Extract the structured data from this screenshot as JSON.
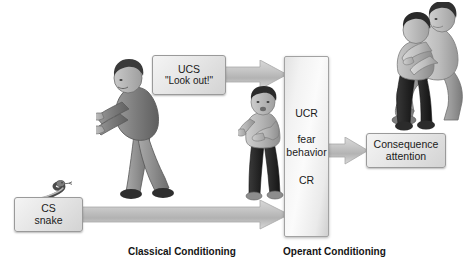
{
  "diagram": {
    "title_present": false,
    "boxes": {
      "ucs": {
        "line1": "UCS",
        "line2": "\"Look out!\""
      },
      "cs": {
        "line1": "CS",
        "line2": "snake"
      },
      "response": {
        "line1": "UCR",
        "line2": "fear",
        "line3": "behavior",
        "line4": "CR"
      },
      "consequence": {
        "line1": "Consequence",
        "line2": "attention"
      }
    },
    "captions": {
      "classical": "Classical Conditioning",
      "operant": "Operant Conditioning"
    },
    "figures": {
      "adult_pointing": "adult-pointing-figure",
      "child": "frightened-child-figure",
      "hug": "adult-comforting-child-figure",
      "snake": "snake-illustration"
    },
    "arrows": {
      "ucs_to_response": "arrow-right",
      "cs_to_response": "arrow-right-long",
      "response_to_consequence": "arrow-right-short"
    },
    "colors": {
      "box_fill": "#e6e6e6",
      "box_border": "#9a9a9a",
      "arrow_fill": "#bfbfbf",
      "text": "#1a1a1a",
      "background": "#ffffff"
    }
  }
}
